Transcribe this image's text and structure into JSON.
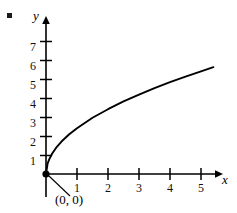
{
  "figure": {
    "background_color": "#ffffff",
    "ink_color": "#000000",
    "list_marker": "•"
  },
  "axes": {
    "x_label": "x",
    "y_label": "y",
    "x_ticks": [
      "1",
      "2",
      "3",
      "4",
      "5"
    ],
    "y_ticks": [
      "1",
      "2",
      "3",
      "4",
      "5",
      "6",
      "7"
    ]
  },
  "annotations": [
    {
      "text": "(0, 0)",
      "point_x": 0,
      "point_y": 0
    }
  ],
  "chart_data": {
    "type": "line",
    "title": "",
    "xlabel": "x",
    "ylabel": "y",
    "xlim": [
      0,
      5.6
    ],
    "ylim": [
      0,
      8.0
    ],
    "grid": false,
    "legend": "none",
    "x_ticks": [
      1,
      2,
      3,
      4,
      5
    ],
    "y_ticks": [
      1,
      2,
      3,
      4,
      5,
      6,
      7
    ],
    "series": [
      {
        "name": "y = sqrt(x)",
        "x": [
          0,
          0.05,
          0.1,
          0.2,
          0.35,
          0.5,
          0.75,
          1,
          1.5,
          2,
          2.5,
          3,
          3.5,
          4,
          4.5,
          5,
          5.4
        ],
        "values": [
          0,
          0.54,
          0.76,
          1.08,
          1.43,
          1.71,
          2.09,
          2.41,
          2.96,
          3.41,
          3.82,
          4.18,
          4.52,
          4.83,
          5.12,
          5.4,
          5.62
        ]
      }
    ],
    "points": [
      {
        "label": "(0, 0)",
        "x": 0,
        "y": 0,
        "marker": "filled-circle"
      }
    ]
  }
}
